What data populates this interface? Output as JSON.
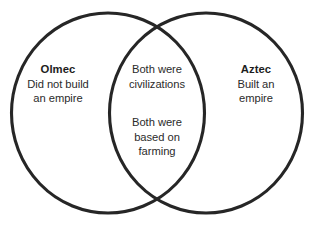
{
  "diagram": {
    "type": "venn",
    "background_color": "#ffffff",
    "stroke_color": "#262626",
    "text_color": "#2b2b2b",
    "heading_color": "#1d1d1d",
    "left_set": {
      "heading": "Olmec",
      "lines": [
        "Did not build",
        "an empire"
      ]
    },
    "right_set": {
      "heading": "Aztec",
      "lines": [
        "Built an",
        "empire"
      ]
    },
    "intersection": {
      "block_one": [
        "Both were",
        "civilizations"
      ],
      "block_two": [
        "Both were",
        "based on",
        "farming"
      ]
    }
  }
}
